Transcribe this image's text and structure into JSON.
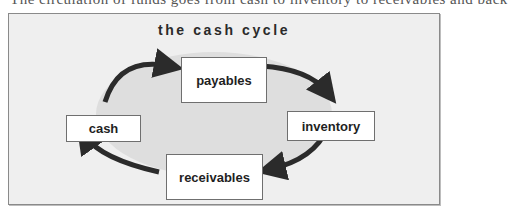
{
  "cropped_top_text": "The circulation of funds goes from cash to inventory to receivables and back",
  "diagram": {
    "title": "the cash cycle",
    "nodes": {
      "payables": "payables",
      "inventory": "inventory",
      "receivables": "receivables",
      "cash": "cash"
    },
    "flow": [
      "cash",
      "payables",
      "inventory",
      "receivables",
      "cash"
    ],
    "colors": {
      "frame_bg": "#efefef",
      "ellipse_fill": "#dedede",
      "arrow": "#2b2b2b",
      "node_bg": "#ffffff"
    }
  }
}
